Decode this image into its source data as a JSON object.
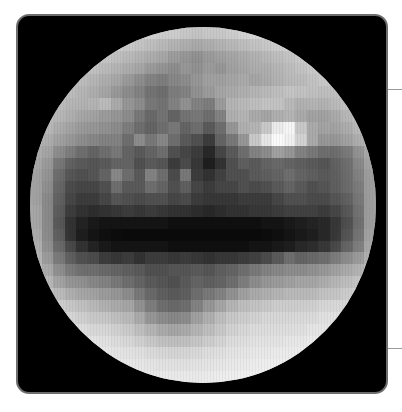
{
  "image": {
    "subject": "pixelated globe of a planetary body",
    "frame_color": "#000000",
    "frame_border_color": "#6e6e6e",
    "tick_color": "#9a9a9a",
    "grid_cols": 30,
    "grid_rows": 30,
    "brightness_rows": [
      [
        210,
        210,
        210,
        210,
        210,
        210,
        210,
        210,
        205,
        200,
        200,
        195,
        195,
        190,
        185,
        190,
        190,
        195,
        200,
        205,
        205,
        210,
        210,
        210,
        210,
        210,
        210,
        210,
        210,
        210
      ],
      [
        205,
        205,
        205,
        205,
        205,
        200,
        200,
        195,
        190,
        185,
        180,
        175,
        170,
        165,
        160,
        165,
        170,
        175,
        180,
        185,
        190,
        195,
        200,
        200,
        205,
        205,
        205,
        205,
        205,
        205
      ],
      [
        200,
        200,
        200,
        200,
        195,
        190,
        185,
        180,
        175,
        170,
        165,
        160,
        150,
        145,
        140,
        150,
        155,
        160,
        165,
        170,
        175,
        180,
        185,
        190,
        195,
        200,
        200,
        200,
        200,
        200
      ],
      [
        195,
        195,
        195,
        190,
        185,
        180,
        175,
        170,
        165,
        160,
        150,
        145,
        140,
        150,
        145,
        155,
        150,
        160,
        165,
        170,
        170,
        175,
        180,
        185,
        190,
        195,
        195,
        195,
        195,
        195
      ],
      [
        190,
        190,
        185,
        180,
        175,
        170,
        165,
        160,
        150,
        140,
        130,
        125,
        135,
        140,
        150,
        160,
        160,
        165,
        170,
        165,
        170,
        175,
        180,
        180,
        185,
        190,
        190,
        190,
        190,
        190
      ],
      [
        185,
        185,
        180,
        175,
        170,
        165,
        160,
        150,
        140,
        130,
        115,
        110,
        125,
        130,
        145,
        155,
        165,
        170,
        175,
        180,
        185,
        190,
        195,
        190,
        185,
        180,
        180,
        185,
        185,
        185
      ],
      [
        180,
        180,
        175,
        170,
        170,
        175,
        185,
        170,
        150,
        140,
        120,
        115,
        130,
        145,
        130,
        125,
        155,
        180,
        185,
        190,
        195,
        195,
        185,
        175,
        175,
        170,
        175,
        180,
        180,
        180
      ],
      [
        175,
        175,
        170,
        165,
        160,
        160,
        155,
        150,
        140,
        120,
        105,
        115,
        100,
        115,
        120,
        110,
        130,
        175,
        180,
        170,
        165,
        175,
        180,
        170,
        160,
        155,
        160,
        170,
        175,
        175
      ],
      [
        170,
        170,
        160,
        155,
        150,
        150,
        145,
        140,
        125,
        110,
        100,
        110,
        120,
        100,
        110,
        90,
        110,
        150,
        175,
        180,
        200,
        235,
        245,
        200,
        170,
        160,
        155,
        160,
        170,
        170
      ],
      [
        165,
        160,
        150,
        145,
        140,
        135,
        130,
        130,
        110,
        140,
        120,
        135,
        110,
        90,
        80,
        60,
        100,
        120,
        150,
        200,
        230,
        250,
        240,
        210,
        170,
        150,
        145,
        150,
        160,
        165
      ],
      [
        155,
        150,
        130,
        120,
        110,
        100,
        110,
        120,
        100,
        90,
        100,
        110,
        80,
        70,
        60,
        40,
        70,
        90,
        110,
        130,
        140,
        160,
        150,
        130,
        120,
        110,
        105,
        110,
        130,
        150
      ],
      [
        150,
        140,
        110,
        95,
        90,
        85,
        90,
        100,
        100,
        80,
        90,
        85,
        60,
        75,
        55,
        30,
        50,
        80,
        95,
        90,
        100,
        105,
        100,
        95,
        90,
        85,
        95,
        100,
        120,
        145
      ],
      [
        145,
        135,
        100,
        85,
        80,
        85,
        100,
        135,
        110,
        90,
        130,
        110,
        75,
        120,
        60,
        50,
        65,
        80,
        80,
        90,
        95,
        100,
        110,
        100,
        95,
        90,
        95,
        100,
        115,
        140
      ],
      [
        145,
        130,
        95,
        75,
        70,
        70,
        80,
        110,
        90,
        90,
        110,
        100,
        80,
        95,
        70,
        60,
        70,
        70,
        80,
        75,
        80,
        90,
        100,
        90,
        80,
        85,
        95,
        100,
        110,
        140
      ],
      [
        145,
        125,
        90,
        70,
        60,
        60,
        70,
        85,
        80,
        75,
        80,
        80,
        70,
        75,
        60,
        55,
        55,
        55,
        60,
        60,
        60,
        70,
        80,
        80,
        75,
        75,
        85,
        90,
        105,
        140
      ],
      [
        150,
        125,
        85,
        60,
        50,
        45,
        50,
        55,
        60,
        55,
        60,
        55,
        50,
        50,
        45,
        40,
        45,
        50,
        50,
        55,
        55,
        60,
        65,
        65,
        65,
        60,
        70,
        80,
        100,
        140
      ],
      [
        150,
        125,
        80,
        50,
        35,
        25,
        20,
        20,
        20,
        20,
        20,
        20,
        15,
        15,
        15,
        15,
        15,
        15,
        15,
        15,
        20,
        20,
        25,
        30,
        35,
        40,
        55,
        70,
        95,
        140
      ],
      [
        155,
        125,
        85,
        50,
        30,
        20,
        15,
        12,
        10,
        10,
        10,
        10,
        10,
        10,
        10,
        10,
        10,
        10,
        10,
        10,
        12,
        15,
        20,
        25,
        30,
        40,
        55,
        75,
        100,
        145
      ],
      [
        160,
        130,
        95,
        70,
        50,
        35,
        25,
        20,
        20,
        20,
        20,
        20,
        15,
        15,
        15,
        15,
        15,
        15,
        15,
        20,
        20,
        25,
        30,
        40,
        45,
        55,
        70,
        90,
        110,
        150
      ],
      [
        165,
        140,
        110,
        90,
        80,
        75,
        60,
        55,
        60,
        50,
        60,
        60,
        55,
        60,
        55,
        50,
        55,
        55,
        60,
        65,
        75,
        90,
        110,
        100,
        105,
        110,
        120,
        130,
        140,
        160
      ],
      [
        175,
        155,
        130,
        115,
        110,
        110,
        105,
        100,
        95,
        90,
        80,
        80,
        85,
        85,
        90,
        85,
        95,
        100,
        110,
        120,
        130,
        135,
        140,
        140,
        145,
        150,
        155,
        160,
        165,
        175
      ],
      [
        185,
        170,
        150,
        140,
        140,
        135,
        130,
        120,
        110,
        100,
        90,
        85,
        80,
        90,
        100,
        95,
        100,
        110,
        125,
        140,
        150,
        155,
        160,
        165,
        165,
        170,
        175,
        180,
        185,
        190
      ],
      [
        195,
        185,
        175,
        165,
        160,
        160,
        155,
        150,
        140,
        120,
        105,
        95,
        90,
        95,
        110,
        120,
        130,
        145,
        160,
        170,
        175,
        180,
        185,
        185,
        185,
        190,
        190,
        195,
        200,
        200
      ],
      [
        210,
        200,
        195,
        190,
        185,
        180,
        175,
        170,
        165,
        145,
        125,
        110,
        105,
        110,
        130,
        150,
        165,
        180,
        190,
        195,
        200,
        205,
        205,
        205,
        205,
        210,
        210,
        210,
        210,
        210
      ],
      [
        220,
        215,
        210,
        205,
        200,
        195,
        195,
        190,
        185,
        170,
        150,
        140,
        135,
        140,
        160,
        175,
        190,
        200,
        205,
        210,
        215,
        215,
        215,
        215,
        215,
        220,
        220,
        220,
        220,
        220
      ],
      [
        225,
        225,
        220,
        220,
        215,
        210,
        210,
        205,
        200,
        190,
        180,
        170,
        165,
        170,
        180,
        190,
        200,
        210,
        215,
        220,
        220,
        220,
        220,
        220,
        225,
        225,
        225,
        225,
        225,
        225
      ],
      [
        230,
        230,
        228,
        225,
        225,
        222,
        220,
        215,
        212,
        205,
        198,
        192,
        190,
        192,
        198,
        205,
        212,
        220,
        222,
        225,
        225,
        225,
        228,
        228,
        230,
        230,
        230,
        230,
        230,
        230
      ],
      [
        232,
        232,
        232,
        230,
        230,
        228,
        226,
        224,
        222,
        220,
        215,
        212,
        210,
        212,
        215,
        220,
        222,
        226,
        228,
        230,
        230,
        232,
        232,
        232,
        232,
        232,
        232,
        232,
        232,
        232
      ],
      [
        235,
        235,
        235,
        235,
        234,
        232,
        230,
        230,
        228,
        226,
        224,
        222,
        222,
        222,
        224,
        226,
        228,
        230,
        232,
        234,
        235,
        235,
        235,
        235,
        235,
        235,
        235,
        235,
        235,
        235
      ],
      [
        238,
        238,
        238,
        238,
        238,
        236,
        235,
        235,
        234,
        232,
        230,
        230,
        230,
        230,
        230,
        232,
        234,
        235,
        236,
        238,
        238,
        238,
        238,
        238,
        238,
        238,
        238,
        238,
        238,
        238
      ]
    ]
  }
}
